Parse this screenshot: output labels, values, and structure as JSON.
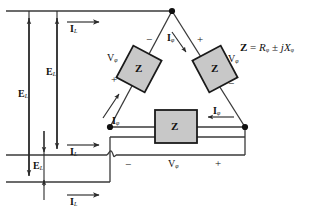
{
  "diagram": {
    "colors": {
      "line": "#3a3a3a",
      "box_fill": "#c8c8c8",
      "box_stroke": "#1a1a1a",
      "node": "#111111",
      "text": "#111111",
      "background": "#ffffff"
    },
    "impedance_boxes": [
      {
        "id": "z-left",
        "label": "Z"
      },
      {
        "id": "z-right",
        "label": "Z"
      },
      {
        "id": "z-bottom",
        "label": "Z"
      }
    ],
    "equation": {
      "lhs": "Z",
      "eq": "=",
      "r": "R",
      "r_sub": "φ",
      "pm": "±",
      "j": "j",
      "x": "X",
      "x_sub": "φ",
      "full": "Z = Rφ ± jXφ"
    },
    "line_currents": [
      {
        "id": "il-top",
        "label": "I",
        "sub": "L"
      },
      {
        "id": "il-middle",
        "label": "I",
        "sub": "L"
      },
      {
        "id": "il-bottom",
        "label": "I",
        "sub": "L"
      }
    ],
    "phase_currents": [
      {
        "id": "iphi-top",
        "label": "I",
        "sub": "φ"
      },
      {
        "id": "iphi-left",
        "label": "I",
        "sub": "φ"
      },
      {
        "id": "iphi-bottom",
        "label": "I",
        "sub": "φ"
      }
    ],
    "phase_voltages": [
      {
        "id": "vphi-left",
        "label": "V",
        "sub": "φ"
      },
      {
        "id": "vphi-right",
        "label": "V",
        "sub": "φ"
      },
      {
        "id": "vphi-bottom",
        "label": "V",
        "sub": "φ"
      }
    ],
    "line_voltages": [
      {
        "id": "el-outer",
        "label": "E",
        "sub": "L"
      },
      {
        "id": "el-middle",
        "label": "E",
        "sub": "L"
      },
      {
        "id": "el-inner",
        "label": "E",
        "sub": "L"
      }
    ],
    "polarity_marks": [
      {
        "id": "polarity-left-minus",
        "sign": "−"
      },
      {
        "id": "polarity-left-plus",
        "sign": "+"
      },
      {
        "id": "polarity-right-plus",
        "sign": "+"
      },
      {
        "id": "polarity-right-minus",
        "sign": "−"
      },
      {
        "id": "polarity-bottom-minus",
        "sign": "−"
      },
      {
        "id": "polarity-bottom-plus",
        "sign": "+"
      }
    ]
  }
}
